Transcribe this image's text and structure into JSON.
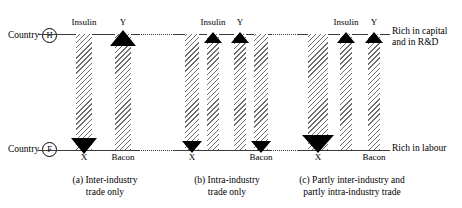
{
  "figure": {
    "top_axis_label_line1": "Rich in capital",
    "top_axis_label_line2": "and in R&D",
    "bottom_axis_label": "Rich in labour",
    "country_top_prefix": "Country",
    "country_top_code": "H",
    "country_bottom_prefix": "Country",
    "country_bottom_code": "F"
  },
  "panels": [
    {
      "id": "a",
      "caption_line1": "(a) Inter-industry",
      "caption_line2": "trade only",
      "flows": [
        {
          "top_label": "Insulin",
          "bottom_label": "X",
          "direction": "down"
        },
        {
          "top_label": "Y",
          "bottom_label": "Bacon",
          "direction": "up"
        }
      ]
    },
    {
      "id": "b",
      "caption_line1": "(b) Intra-industry",
      "caption_line2": "trade only",
      "flows": [
        {
          "top_label": "",
          "bottom_label": "X",
          "direction": "down"
        },
        {
          "top_label": "Insulin",
          "bottom_label": "",
          "direction": "up"
        },
        {
          "top_label": "Y",
          "bottom_label": "",
          "direction": "up"
        },
        {
          "top_label": "",
          "bottom_label": "Bacon",
          "direction": "down"
        }
      ]
    },
    {
      "id": "c",
      "caption_line1": "(c) Partly inter-industry and",
      "caption_line2": "partly intra-industry trade",
      "flows": [
        {
          "top_label": "",
          "bottom_label": "X",
          "direction": "down"
        },
        {
          "top_label": "Insulin",
          "bottom_label": "",
          "direction": "up"
        },
        {
          "top_label": "Y",
          "bottom_label": "Bacon",
          "direction": "up"
        }
      ]
    }
  ]
}
